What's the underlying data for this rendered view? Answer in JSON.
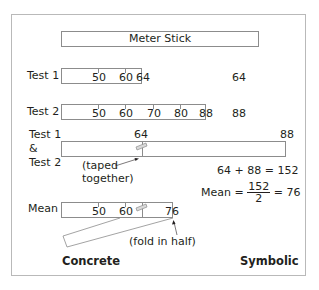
{
  "title": "Meter Stick",
  "rows": {
    "test1": {
      "label": "Test 1",
      "ticks": [
        "50",
        "60",
        "64"
      ],
      "symbolic": "64"
    },
    "test2": {
      "label": "Test 2",
      "ticks": [
        "50",
        "60",
        "70",
        "80",
        "88"
      ],
      "symbolic": "88"
    },
    "combined": {
      "label_line1": "Test 1",
      "label_line2": "&",
      "label_line3": "Test 2",
      "join_value": "64",
      "end_value": "88",
      "annotation_line1": "(taped",
      "annotation_line2": "together)",
      "sum_equation": "64 + 88 = 152"
    },
    "mean": {
      "label": "Mean",
      "ticks": [
        "50",
        "60",
        "76"
      ],
      "annotation": "(fold in half)",
      "equation_prefix": "Mean =",
      "fraction_numerator": "152",
      "fraction_denominator": "2",
      "equation_suffix": "= 76"
    }
  },
  "footer": {
    "left": "Concrete",
    "right": "Symbolic"
  },
  "colors": {
    "border": "#8c8c8c",
    "frame": "#b9b9b9",
    "text": "#231f20",
    "tape_fill": "#d9d9d9"
  }
}
